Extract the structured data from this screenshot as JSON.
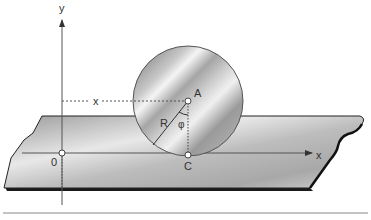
{
  "diagram": {
    "type": "rolling-disc-on-plane",
    "labels": {
      "y_axis": "y",
      "x_axis": "x",
      "x_coordinate": "x",
      "origin": "0",
      "center": "A",
      "contact_point": "C",
      "radius": "R",
      "angle": "φ"
    },
    "colors": {
      "background": "#ffffff",
      "plane_light": "#e6e6e6",
      "plane_dark": "#8c8c8c",
      "plane_edge": "#1a1a1a",
      "disc_light": "#f2f2f2",
      "disc_dark": "#7a7a7a",
      "lines": "#555555",
      "text": "#333333"
    }
  }
}
